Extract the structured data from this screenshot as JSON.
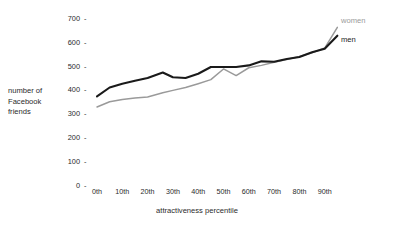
{
  "chart_data": {
    "type": "line",
    "title": "",
    "xlabel": "attractiveness percentile",
    "ylabel": "number of Facebook friends",
    "ylabel_lines": [
      "number of",
      "Facebook",
      "friends"
    ],
    "ylim": [
      0,
      700
    ],
    "xlim": [
      0,
      97
    ],
    "grid": false,
    "legend_position": "right-end-of-lines",
    "ytick_labels": [
      "700",
      "600",
      "500",
      "400",
      "300",
      "200",
      "100",
      "0"
    ],
    "ytick_values": [
      700,
      600,
      500,
      400,
      300,
      200,
      100,
      0
    ],
    "ytick_mark": "-",
    "xtick_labels": [
      "0th",
      "10th",
      "20th",
      "30th",
      "40th",
      "50th",
      "60th",
      "70th",
      "80th",
      "90th"
    ],
    "xtick_values": [
      0,
      10,
      20,
      30,
      40,
      50,
      60,
      70,
      80,
      90
    ],
    "x": [
      0,
      5,
      10,
      15,
      20,
      26,
      30,
      35,
      40,
      45,
      50,
      55,
      60,
      65,
      70,
      75,
      80,
      85,
      90,
      95
    ],
    "series": [
      {
        "name": "men",
        "label": "men",
        "color": "#1a1a1a",
        "width": 2.1,
        "values": [
          375,
          412,
          428,
          440,
          452,
          475,
          455,
          452,
          470,
          498,
          498,
          498,
          505,
          522,
          520,
          532,
          540,
          560,
          575,
          630
        ]
      },
      {
        "name": "women",
        "label": "women",
        "color": "#9a9a9a",
        "width": 1.5,
        "values": [
          330,
          352,
          362,
          368,
          372,
          390,
          400,
          412,
          428,
          445,
          490,
          462,
          495,
          505,
          518,
          530,
          542,
          558,
          578,
          665
        ]
      }
    ]
  },
  "legend": {
    "women": "women",
    "men": "men"
  },
  "axes": {
    "x_title": "attractiveness percentile",
    "y_title_lines": [
      "number of",
      "Facebook",
      "friends"
    ]
  }
}
